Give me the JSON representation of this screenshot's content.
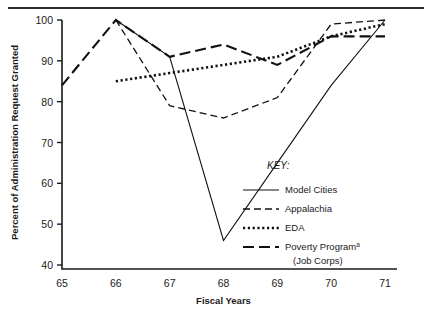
{
  "chart_data": {
    "type": "line",
    "title": "",
    "xlabel": "Fiscal Years",
    "ylabel": "Percent of Administration Request Granted",
    "x": [
      65,
      66,
      67,
      68,
      69,
      70,
      71
    ],
    "xticklabels": [
      "65",
      "66",
      "67",
      "68",
      "69",
      "70",
      "71"
    ],
    "yticks": [
      40,
      50,
      60,
      70,
      80,
      90,
      100
    ],
    "yticklabels": [
      "40",
      "50",
      "60",
      "70",
      "80",
      "90",
      "100"
    ],
    "xlim": [
      65,
      71
    ],
    "ylim": [
      36,
      100
    ],
    "grid": false,
    "legend_position": "inside-right",
    "legend_title": "KEY:",
    "series": [
      {
        "name": "Model Cities",
        "style": "solid",
        "x": [
          66,
          67,
          68,
          69,
          70,
          71
        ],
        "values": [
          100,
          91,
          46,
          65,
          84,
          100
        ]
      },
      {
        "name": "Appalachia",
        "style": "dashed",
        "x": [
          66,
          67,
          68,
          69,
          70,
          71
        ],
        "values": [
          100,
          79,
          76,
          81,
          99,
          100
        ]
      },
      {
        "name": "EDA",
        "style": "dotted",
        "x": [
          66,
          67,
          68,
          69,
          70,
          71
        ],
        "values": [
          85,
          87,
          89,
          91,
          96,
          99
        ]
      },
      {
        "name": "Poverty Program",
        "style": "longdash",
        "x": [
          65,
          66,
          67,
          68,
          69,
          70,
          71
        ],
        "values": [
          84,
          100,
          91,
          94,
          89,
          96,
          96
        ]
      }
    ],
    "legend_entries": [
      {
        "label": "Model Cities",
        "style": "solid",
        "superscript": "",
        "sublabel": ""
      },
      {
        "label": "Appalachia",
        "style": "dashed",
        "superscript": "",
        "sublabel": ""
      },
      {
        "label": "EDA",
        "style": "dotted",
        "superscript": "",
        "sublabel": ""
      },
      {
        "label": "Poverty Program",
        "style": "longdash",
        "superscript": "a",
        "sublabel": "(Job Corps)"
      }
    ]
  },
  "colors": {
    "ink": "#1a1a1a",
    "line": "#111111",
    "rule": "#2b2b2b",
    "caption": "#b9b9b9"
  }
}
